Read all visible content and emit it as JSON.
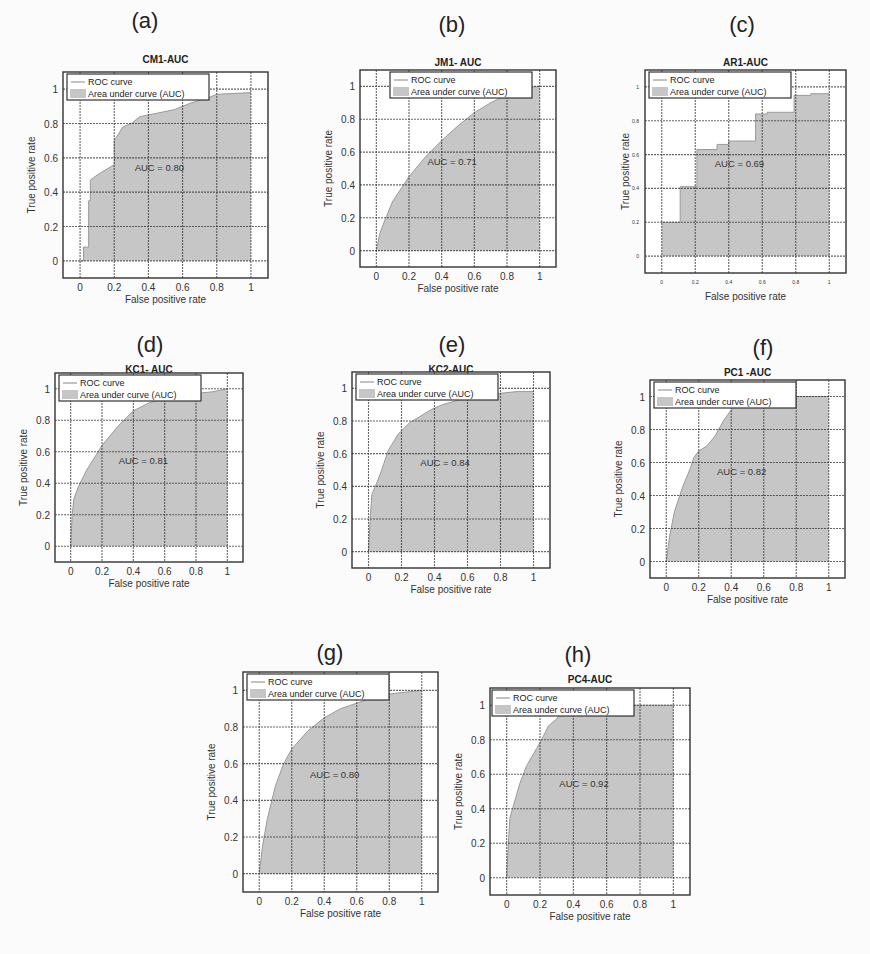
{
  "figure": {
    "legend_line": "ROC curve",
    "legend_area": "Area under curve (AUC)",
    "xlabel": "False positive rate",
    "ylabel": "True positive rate",
    "xticks": [
      "0",
      "0.2",
      "0.4",
      "0.6",
      "0.8",
      "1"
    ],
    "yticks": [
      "0",
      "0.2",
      "0.4",
      "0.6",
      "0.8",
      "1"
    ],
    "fill_color": "#c6c6c6",
    "curve_color": "#9a9a9a"
  },
  "panels": [
    {
      "label": "(a)",
      "title": "CM1-AUC",
      "auc_text": "AUC = 0.80"
    },
    {
      "label": "(b)",
      "title": "JM1- AUC",
      "auc_text": "AUC = 0.71"
    },
    {
      "label": "(c)",
      "title": "AR1-AUC",
      "auc_text": "AUC = 0.69"
    },
    {
      "label": "(d)",
      "title": "KC1- AUC",
      "auc_text": "AUC = 0.81"
    },
    {
      "label": "(e)",
      "title": "KC2-AUC",
      "auc_text": "AUC = 0.84"
    },
    {
      "label": "(f)",
      "title": "PC1 -AUC",
      "auc_text": "AUC = 0.82"
    },
    {
      "label": "(g)",
      "title": "PC3 -AUC",
      "auc_text": "AUC = 0.80"
    },
    {
      "label": "(h)",
      "title": "PC4-AUC",
      "auc_text": "AUC = 0.92"
    }
  ],
  "chart_data": [
    {
      "type": "area",
      "title": "CM1-AUC",
      "panel": "(a)",
      "xlabel": "False positive rate",
      "ylabel": "True positive rate",
      "xlim": [
        -0.1,
        1.1
      ],
      "ylim": [
        -0.1,
        1.1
      ],
      "grid": true,
      "legend_position": "top-left",
      "legend": [
        "ROC curve",
        "Area under curve (AUC)"
      ],
      "annotation": "AUC = 0.80",
      "auc": 0.8,
      "x": [
        0,
        0.02,
        0.02,
        0.05,
        0.05,
        0.06,
        0.06,
        0.1,
        0.2,
        0.2,
        0.25,
        0.3,
        0.35,
        0.45,
        0.55,
        0.65,
        0.75,
        0.8,
        1.0
      ],
      "y": [
        0,
        0,
        0.08,
        0.08,
        0.35,
        0.35,
        0.47,
        0.5,
        0.56,
        0.7,
        0.78,
        0.8,
        0.84,
        0.86,
        0.88,
        0.92,
        0.95,
        0.97,
        0.98
      ]
    },
    {
      "type": "area",
      "title": "JM1- AUC",
      "panel": "(b)",
      "xlabel": "False positive rate",
      "ylabel": "True positive rate",
      "xlim": [
        -0.1,
        1.1
      ],
      "ylim": [
        -0.1,
        1.1
      ],
      "grid": true,
      "legend_position": "top-left",
      "legend": [
        "ROC curve",
        "Area under curve (AUC)"
      ],
      "annotation": "AUC = 0.71",
      "auc": 0.71,
      "x": [
        0,
        0.02,
        0.05,
        0.1,
        0.2,
        0.3,
        0.4,
        0.5,
        0.6,
        0.7,
        0.8,
        0.9,
        1.0
      ],
      "y": [
        0,
        0.1,
        0.18,
        0.3,
        0.45,
        0.57,
        0.67,
        0.76,
        0.84,
        0.9,
        0.95,
        0.99,
        1.0
      ]
    },
    {
      "type": "area",
      "title": "AR1-AUC",
      "panel": "(c)",
      "xlabel": "False positive rate",
      "ylabel": "True positive rate",
      "xlim": [
        -0.1,
        1.1
      ],
      "ylim": [
        -0.1,
        1.1
      ],
      "grid": true,
      "legend_position": "top-left",
      "legend": [
        "ROC curve",
        "Area under curve (AUC)"
      ],
      "annotation": "AUC = 0.69",
      "auc": 0.69,
      "x": [
        0,
        0.11,
        0.11,
        0.21,
        0.21,
        0.33,
        0.33,
        0.4,
        0.4,
        0.56,
        0.56,
        0.63,
        0.63,
        0.79,
        0.79,
        0.89,
        0.89,
        1.0
      ],
      "y": [
        0.2,
        0.2,
        0.41,
        0.41,
        0.63,
        0.63,
        0.66,
        0.66,
        0.68,
        0.68,
        0.84,
        0.84,
        0.85,
        0.85,
        0.95,
        0.95,
        0.96,
        0.96
      ]
    },
    {
      "type": "area",
      "title": "KC1- AUC",
      "panel": "(d)",
      "xlabel": "False positive rate",
      "ylabel": "True positive rate",
      "xlim": [
        -0.1,
        1.1
      ],
      "ylim": [
        -0.1,
        1.1
      ],
      "grid": true,
      "legend_position": "top-left",
      "legend": [
        "ROC curve",
        "Area under curve (AUC)"
      ],
      "annotation": "AUC = 0.81",
      "auc": 0.81,
      "x": [
        0,
        0.01,
        0.02,
        0.05,
        0.1,
        0.15,
        0.2,
        0.3,
        0.4,
        0.5,
        0.6,
        0.7,
        0.8,
        0.9,
        1.0
      ],
      "y": [
        0,
        0.2,
        0.3,
        0.38,
        0.48,
        0.56,
        0.64,
        0.76,
        0.86,
        0.91,
        0.94,
        0.96,
        0.97,
        0.98,
        1.0
      ]
    },
    {
      "type": "area",
      "title": "KC2-AUC",
      "panel": "(e)",
      "xlabel": "False positive rate",
      "ylabel": "True positive rate",
      "xlim": [
        -0.1,
        1.1
      ],
      "ylim": [
        -0.1,
        1.1
      ],
      "grid": true,
      "legend_position": "top-left",
      "legend": [
        "ROC curve",
        "Area under curve (AUC)"
      ],
      "annotation": "AUC = 0.84",
      "auc": 0.84,
      "x": [
        0,
        0.01,
        0.02,
        0.05,
        0.08,
        0.12,
        0.18,
        0.25,
        0.3,
        0.38,
        0.45,
        0.55,
        0.65,
        0.8,
        0.9,
        1.0
      ],
      "y": [
        0,
        0.2,
        0.35,
        0.42,
        0.5,
        0.62,
        0.72,
        0.79,
        0.82,
        0.87,
        0.9,
        0.93,
        0.95,
        0.97,
        0.98,
        0.98
      ]
    },
    {
      "type": "area",
      "title": "PC1 -AUC",
      "panel": "(f)",
      "xlabel": "False positive rate",
      "ylabel": "True positive rate",
      "xlim": [
        -0.1,
        1.1
      ],
      "ylim": [
        -0.1,
        1.1
      ],
      "grid": true,
      "legend_position": "top-left",
      "legend": [
        "ROC curve",
        "Area under curve (AUC)"
      ],
      "annotation": "AUC = 0.82",
      "auc": 0.82,
      "x": [
        0,
        0.02,
        0.05,
        0.1,
        0.15,
        0.17,
        0.2,
        0.25,
        0.3,
        0.35,
        0.4,
        0.5,
        0.7,
        1.0
      ],
      "y": [
        0,
        0.15,
        0.3,
        0.45,
        0.57,
        0.63,
        0.67,
        0.7,
        0.76,
        0.85,
        0.92,
        0.98,
        1.0,
        1.0
      ]
    },
    {
      "type": "area",
      "title": "PC3 -AUC",
      "panel": "(g)",
      "xlabel": "False positive rate",
      "ylabel": "True positive rate",
      "xlim": [
        -0.1,
        1.1
      ],
      "ylim": [
        -0.1,
        1.1
      ],
      "grid": true,
      "legend_position": "top-left",
      "legend": [
        "ROC curve",
        "Area under curve (AUC)"
      ],
      "annotation": "AUC = 0.80",
      "auc": 0.8,
      "x": [
        0,
        0.02,
        0.05,
        0.1,
        0.15,
        0.2,
        0.3,
        0.4,
        0.5,
        0.6,
        0.7,
        0.8,
        0.9,
        1.0
      ],
      "y": [
        0,
        0.15,
        0.3,
        0.48,
        0.6,
        0.68,
        0.78,
        0.85,
        0.9,
        0.93,
        0.96,
        0.98,
        0.99,
        1.0
      ]
    },
    {
      "type": "area",
      "title": "PC4-AUC",
      "panel": "(h)",
      "xlabel": "False positive rate",
      "ylabel": "True positive rate",
      "xlim": [
        -0.1,
        1.1
      ],
      "ylim": [
        -0.1,
        1.1
      ],
      "grid": true,
      "legend_position": "top-left",
      "legend": [
        "ROC curve",
        "Area under curve (AUC)"
      ],
      "annotation": "AUC = 0.92",
      "auc": 0.92,
      "x": [
        0,
        0.01,
        0.02,
        0.05,
        0.08,
        0.12,
        0.18,
        0.22,
        0.25,
        0.3,
        0.35,
        0.5,
        1.0
      ],
      "y": [
        0,
        0.2,
        0.35,
        0.45,
        0.55,
        0.65,
        0.75,
        0.82,
        0.88,
        0.92,
        1.0,
        1.0,
        1.0
      ]
    }
  ]
}
